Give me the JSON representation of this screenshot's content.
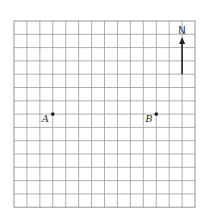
{
  "grid": {
    "columns": 14,
    "rows": 14,
    "left": 14,
    "top": 21,
    "cell_width": 12.93,
    "cell_height": 13.3,
    "line_color": "#9a9a9a"
  },
  "points": [
    {
      "label": "A",
      "col": 3,
      "row": 7
    },
    {
      "label": "B",
      "col": 11,
      "row": 7
    }
  ],
  "compass": {
    "label": "N",
    "col": 13,
    "row_top": 1.2,
    "row_bottom": 4,
    "color": "#222222"
  }
}
